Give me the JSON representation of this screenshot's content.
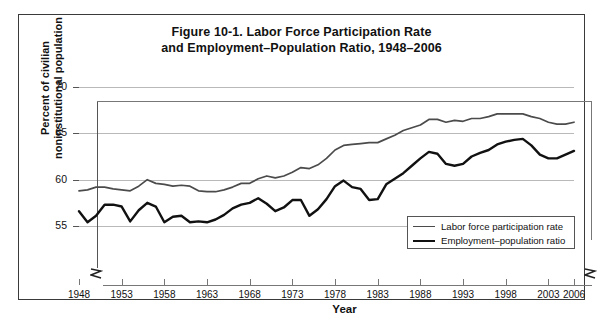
{
  "figure": {
    "title_line1": "Figure 10-1. Labor Force Participation Rate",
    "title_line2": "and Employment–Population Ratio, 1948–2006",
    "border_color": "#3a3a3a"
  },
  "axes": {
    "y_title_line1": "Percent of civilian",
    "y_title_line2": "noninstitutional population",
    "x_title": "Year",
    "y_ticks": [
      "55",
      "60",
      "65",
      "70"
    ],
    "x_ticks": [
      "1948",
      "1953",
      "1958",
      "1963",
      "1968",
      "1973",
      "1978",
      "1983",
      "1988",
      "1993",
      "1998",
      "2003",
      "2006"
    ],
    "y_break_glyph": "≈",
    "x_break_glyph": "≈"
  },
  "legend": {
    "items": [
      {
        "label": "Labor force participation rate",
        "color": "#4b4b4b",
        "width": 1.7
      },
      {
        "label": "Employment–population ratio",
        "color": "#111111",
        "width": 2.4
      }
    ]
  },
  "chart_data": {
    "type": "line",
    "title": "Figure 10-1. Labor Force Participation Rate and Employment–Population Ratio, 1948–2006",
    "xlabel": "Year",
    "ylabel": "Percent of civilian noninstitutional population",
    "xlim": [
      1948,
      2006
    ],
    "ylim": [
      55,
      70
    ],
    "yticks": [
      55,
      60,
      65,
      70
    ],
    "xticks": [
      1948,
      1953,
      1958,
      1963,
      1968,
      1973,
      1978,
      1983,
      1988,
      1993,
      1998,
      2003,
      2006
    ],
    "grid": "horizontal",
    "legend_position": "lower-right-inside",
    "y_axis_broken_below": 55,
    "x": [
      1948,
      1949,
      1950,
      1951,
      1952,
      1953,
      1954,
      1955,
      1956,
      1957,
      1958,
      1959,
      1960,
      1961,
      1962,
      1963,
      1964,
      1965,
      1966,
      1967,
      1968,
      1969,
      1970,
      1971,
      1972,
      1973,
      1974,
      1975,
      1976,
      1977,
      1978,
      1979,
      1980,
      1981,
      1982,
      1983,
      1984,
      1985,
      1986,
      1987,
      1988,
      1989,
      1990,
      1991,
      1992,
      1993,
      1994,
      1995,
      1996,
      1997,
      1998,
      1999,
      2000,
      2001,
      2002,
      2003,
      2004,
      2005,
      2006
    ],
    "series": [
      {
        "name": "Labor force participation rate",
        "color": "#4b4b4b",
        "linewidth": 1.7,
        "values": [
          58.8,
          58.9,
          59.2,
          59.2,
          59.0,
          58.9,
          58.8,
          59.3,
          60.0,
          59.6,
          59.5,
          59.3,
          59.4,
          59.3,
          58.8,
          58.7,
          58.7,
          58.9,
          59.2,
          59.6,
          59.6,
          60.1,
          60.4,
          60.2,
          60.4,
          60.8,
          61.3,
          61.2,
          61.6,
          62.3,
          63.2,
          63.7,
          63.8,
          63.9,
          64.0,
          64.0,
          64.4,
          64.8,
          65.3,
          65.6,
          65.9,
          66.5,
          66.5,
          66.2,
          66.4,
          66.3,
          66.6,
          66.6,
          66.8,
          67.1,
          67.1,
          67.1,
          67.1,
          66.8,
          66.6,
          66.2,
          66.0,
          66.0,
          66.2
        ]
      },
      {
        "name": "Employment–population ratio",
        "color": "#111111",
        "linewidth": 2.4,
        "values": [
          56.6,
          55.4,
          56.1,
          57.3,
          57.3,
          57.1,
          55.5,
          56.7,
          57.5,
          57.1,
          55.4,
          56.0,
          56.1,
          55.4,
          55.5,
          55.4,
          55.7,
          56.2,
          56.9,
          57.3,
          57.5,
          58.0,
          57.4,
          56.6,
          57.0,
          57.8,
          57.8,
          56.1,
          56.8,
          57.9,
          59.3,
          59.9,
          59.2,
          59.0,
          57.8,
          57.9,
          59.5,
          60.1,
          60.7,
          61.5,
          62.3,
          63.0,
          62.8,
          61.7,
          61.5,
          61.7,
          62.5,
          62.9,
          63.2,
          63.8,
          64.1,
          64.3,
          64.4,
          63.7,
          62.7,
          62.3,
          62.3,
          62.7,
          63.1
        ]
      }
    ]
  }
}
